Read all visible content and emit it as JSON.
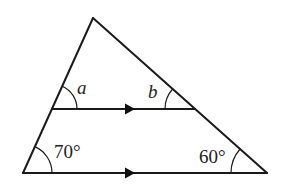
{
  "diagram": {
    "type": "triangle-with-parallel-line",
    "colors": {
      "stroke": "#1a1a1a",
      "background": "#ffffff"
    },
    "vertices": {
      "apex": [
        93,
        18
      ],
      "bottom_left": [
        23,
        173
      ],
      "bottom_right": [
        267,
        173
      ],
      "mid_left": [
        52,
        109
      ],
      "mid_right": [
        195,
        109
      ]
    },
    "parallel_marker": "arrow-right",
    "angles": {
      "a": {
        "label": "a",
        "position": "upper-left, between left side and middle parallel line"
      },
      "b": {
        "label": "b",
        "position": "upper-right, between right side and middle parallel line"
      },
      "bottom_left": {
        "label": "70°",
        "value_degrees": 70
      },
      "bottom_right": {
        "label": "60°",
        "value_degrees": 60
      }
    }
  }
}
